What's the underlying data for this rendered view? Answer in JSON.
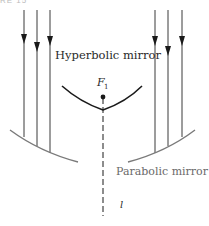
{
  "figure": {
    "header_fragment": "RE 15",
    "labels": {
      "hyperbolic_mirror": "Hyperbolic mirror",
      "parabolic_mirror": "Parabolic mirror",
      "focus": "F",
      "focus_subscript": "1",
      "axis": "l"
    },
    "colors": {
      "ink": "#1a1a1a",
      "mirror_gray": "#7a7a7a",
      "text_gray": "#6a6a6a"
    },
    "incoming_rays": {
      "left_x": [
        24,
        37,
        50
      ],
      "right_x": [
        155,
        168,
        182
      ],
      "count": 6
    }
  }
}
